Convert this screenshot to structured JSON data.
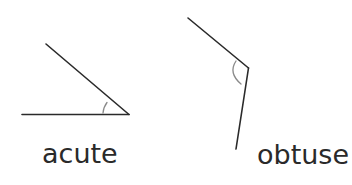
{
  "diagram": {
    "title": "",
    "colors": {
      "line": "#2a2a2a",
      "arc": "#8a8a8a",
      "background": "#ffffff"
    },
    "figures": [
      {
        "id": "acute",
        "label": "acute",
        "vertex": [
          129,
          114
        ],
        "ray1_end": [
          22,
          114
        ],
        "ray2_end": [
          46,
          44
        ],
        "arc_marker": true
      },
      {
        "id": "obtuse",
        "label": "obtuse",
        "vertex": [
          248,
          68
        ],
        "ray1_end": [
          188,
          18
        ],
        "ray2_end": [
          236,
          149
        ],
        "arc_marker": true
      }
    ]
  }
}
